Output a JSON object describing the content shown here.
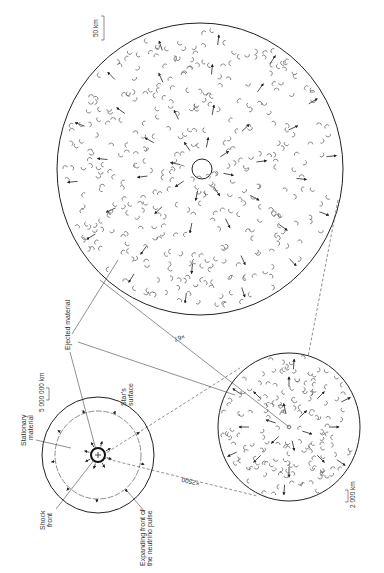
{
  "figure": {
    "type": "supernova core collapse diagram",
    "orientation": "rotated 90deg (labels read bottom-to-top)",
    "colors": {
      "line": "#222222",
      "fill_pattern": "#d9d9d9",
      "blob": "#666666",
      "background": "#ffffff"
    }
  },
  "star_view": {
    "labels": {
      "stationary_material": "Stationary material",
      "shock_front": "Shock front",
      "expanding_front": "Expanding front of the neutrino pulse",
      "stars_surface": "Star's surface",
      "scale": "5 000 000 km"
    }
  },
  "medium_view": {
    "magnification": "×2500",
    "scale": "2 000 km"
  },
  "large_view": {
    "magnification": "×67",
    "scale": "50 km"
  },
  "shared_labels": {
    "ejected_material": "Ejected material"
  }
}
